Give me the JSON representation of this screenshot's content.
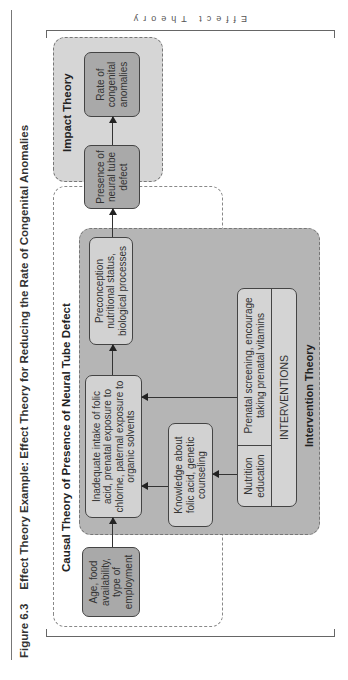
{
  "figure": {
    "number": "Figure 6.3",
    "title": "Effect Theory Example: Effect Theory for Reducing the Rate of Congenital Anomalies",
    "side_label": "Effect Theory"
  },
  "sections": {
    "impact": "Impact Theory",
    "causal": "Causal Theory of Presence of Neural Tube Defect",
    "intervention": "Intervention Theory"
  },
  "nodes": {
    "rate": "Rate of congenital anomalies",
    "presence": "Presence of neural tube defect",
    "preconception": "Preconception nutritional status, biological processes",
    "inadequate": "Inadequate intake of folic acid, prenatal exposure to chlorine, paternal exposure to organic solvents",
    "knowledge": "Knowledge about folic acid, genetic counseling",
    "age": "Age, food availability, type of employment"
  },
  "interventions": {
    "label": "INTERVENTIONS",
    "items": [
      "Nutrition education",
      "Prenatal screening, encourage taking prenatal vitamins"
    ]
  },
  "colors": {
    "impact_bg": "#d6d6d6",
    "intervention_bg": "#b5b5b5",
    "dark_node": "#a9a9a9",
    "light_node": "#d2d2d2"
  }
}
